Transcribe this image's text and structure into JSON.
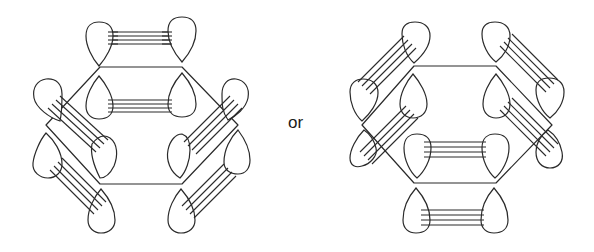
{
  "figure": {
    "separator_text": "or",
    "stroke_color": "#2a2a2a",
    "background_color": "#ffffff"
  },
  "diagrams": [
    {
      "name": "left-arrangement",
      "hexagon": [
        [
          100,
          67
        ],
        [
          182,
          67
        ],
        [
          238,
          125
        ],
        [
          182,
          184
        ],
        [
          100,
          184
        ],
        [
          46,
          125
        ]
      ],
      "lobe_pairs": [
        {
          "position": "top-outer",
          "orientation": "horizontal",
          "lobes": [
            [
              99,
              44,
              "down"
            ],
            [
              182,
              40,
              "down"
            ]
          ]
        },
        {
          "position": "top-inner",
          "orientation": "horizontal",
          "lobes": [
            [
              99,
              100,
              "up"
            ],
            [
              182,
              100,
              "up"
            ]
          ]
        },
        {
          "position": "upper-left",
          "orientation": "diagonal",
          "lobes": [
            [
              48,
              98,
              "down"
            ],
            [
              101,
              154,
              "up"
            ]
          ]
        },
        {
          "position": "lower-left",
          "orientation": "diagonal",
          "lobes": [
            [
              48,
              155,
              "up"
            ],
            [
              101,
              211,
              "up"
            ]
          ]
        },
        {
          "position": "upper-right",
          "orientation": "diagonal",
          "lobes": [
            [
              236,
              100,
              "down"
            ],
            [
              182,
              154,
              "up"
            ]
          ]
        },
        {
          "position": "lower-right",
          "orientation": "diagonal",
          "lobes": [
            [
              236,
              155,
              "up"
            ],
            [
              182,
              211,
              "up"
            ]
          ]
        }
      ]
    },
    {
      "name": "right-arrangement",
      "hexagon": [
        [
          414,
          66
        ],
        [
          496,
          66
        ],
        [
          552,
          125
        ],
        [
          496,
          183
        ],
        [
          414,
          183
        ],
        [
          362,
          125
        ]
      ],
      "lobe_pairs": [
        {
          "position": "upper-left",
          "orientation": "diagonal",
          "lobes": [
            [
              409,
              40,
              "down"
            ],
            [
              363,
              88,
              "down"
            ]
          ]
        },
        {
          "position": "upper-right",
          "orientation": "diagonal",
          "lobes": [
            [
              496,
              40,
              "down"
            ],
            [
              550,
              88,
              "down"
            ]
          ]
        },
        {
          "position": "inner-left-top",
          "orientation": "diagonal",
          "lobes": [
            [
              413,
              96,
              "up"
            ],
            [
              364,
              150,
              "down"
            ]
          ]
        },
        {
          "position": "inner-right-top",
          "orientation": "diagonal",
          "lobes": [
            [
              496,
              96,
              "up"
            ],
            [
              549,
              150,
              "down"
            ]
          ]
        },
        {
          "position": "bottom-inner",
          "orientation": "horizontal",
          "lobes": [
            [
              417,
              155,
              "down"
            ],
            [
              495,
              155,
              "down"
            ]
          ]
        },
        {
          "position": "bottom-outer",
          "orientation": "horizontal",
          "lobes": [
            [
              416,
              210,
              "up"
            ],
            [
              494,
              210,
              "up"
            ]
          ]
        }
      ]
    }
  ]
}
